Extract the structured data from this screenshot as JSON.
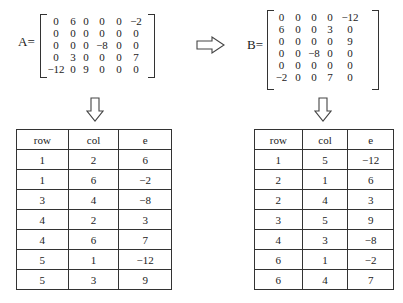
{
  "matrix_a": {
    "label": "A=",
    "rows": [
      [
        "0",
        "6",
        "0",
        "0",
        "0",
        "−2"
      ],
      [
        "0",
        "0",
        "0",
        "0",
        "0",
        "0"
      ],
      [
        "0",
        "0",
        "0",
        "−8",
        "0",
        "0"
      ],
      [
        "0",
        "3",
        "0",
        "0",
        "0",
        "7"
      ],
      [
        "−12",
        "0",
        "9",
        "0",
        "0",
        "0"
      ]
    ]
  },
  "matrix_b": {
    "label": "B=",
    "rows": [
      [
        "0",
        "0",
        "0",
        "0",
        "−12"
      ],
      [
        "6",
        "0",
        "0",
        "3",
        "0"
      ],
      [
        "0",
        "0",
        "0",
        "0",
        "9"
      ],
      [
        "0",
        "0",
        "−8",
        "0",
        "0"
      ],
      [
        "0",
        "0",
        "0",
        "0",
        "0"
      ],
      [
        "−2",
        "0",
        "0",
        "7",
        "0"
      ]
    ]
  },
  "arrows": {
    "transpose": "right-arrow-icon",
    "to_triples_a": "down-arrow-icon",
    "to_triples_b": "down-arrow-icon"
  },
  "table_a": {
    "headers": [
      "row",
      "col",
      "e"
    ],
    "rows": [
      [
        "1",
        "2",
        "6"
      ],
      [
        "1",
        "6",
        "−2"
      ],
      [
        "3",
        "4",
        "−8"
      ],
      [
        "4",
        "2",
        "3"
      ],
      [
        "4",
        "6",
        "7"
      ],
      [
        "5",
        "1",
        "−12"
      ],
      [
        "5",
        "3",
        "9"
      ]
    ]
  },
  "table_b": {
    "headers": [
      "row",
      "col",
      "e"
    ],
    "rows": [
      [
        "1",
        "5",
        "−12"
      ],
      [
        "2",
        "1",
        "6"
      ],
      [
        "2",
        "4",
        "3"
      ],
      [
        "3",
        "5",
        "9"
      ],
      [
        "4",
        "3",
        "−8"
      ],
      [
        "6",
        "1",
        "−2"
      ],
      [
        "6",
        "4",
        "7"
      ]
    ]
  }
}
